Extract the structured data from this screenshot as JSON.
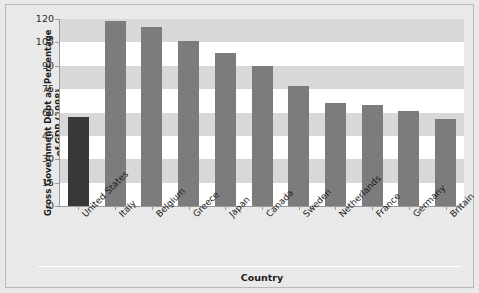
{
  "chart_data": {
    "type": "bar",
    "title": "",
    "xlabel": "Country",
    "ylabel": "Gross Government Debt as Percentage of GDP (1998)",
    "ylabel_line1": "Gross Government Debt as Percentage",
    "ylabel_line2": "of GDP (1998)",
    "categories": [
      "United States",
      "Italy",
      "Belgium",
      "Greece",
      "Japan",
      "Canada",
      "Sweden",
      "Netherlands",
      "France",
      "Germany",
      "Britain"
    ],
    "values": [
      57,
      119,
      115,
      106,
      98,
      90,
      77,
      66,
      65,
      61,
      56
    ],
    "ylim": [
      0,
      120
    ],
    "yticks": [
      0,
      15,
      30,
      45,
      60,
      75,
      90,
      105,
      120
    ],
    "ytick_labels": [
      "0",
      "15",
      "30",
      "45",
      "60",
      "75",
      "90",
      "105",
      "120"
    ],
    "grid": "alternating-horizontal-bands",
    "legend": "none",
    "highlight_category": "United States",
    "colors": {
      "bar": "#7c7c7c",
      "bar_highlight": "#383838",
      "band": "#d8d8d8",
      "plot_background": "#ffffff",
      "figure_background": "#e9e9e9",
      "axis": "#9a9a9a",
      "text": "#1c1c1c"
    }
  }
}
